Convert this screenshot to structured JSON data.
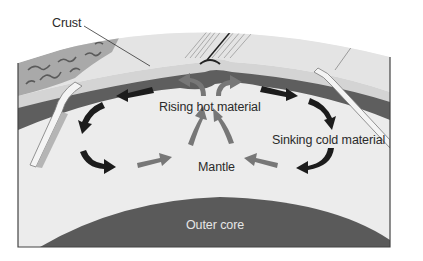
{
  "diagram": {
    "labels": {
      "crust": "Crust",
      "rising": "Rising hot material",
      "sinking": "Sinking cold material",
      "mantle": "Mantle",
      "outer_core": "Outer core"
    },
    "colors": {
      "background": "#ffffff",
      "mantle": "#ececec",
      "lithosphere_dark": "#5e5e5e",
      "crust_light": "#dcdcdc",
      "continent": "#a8a8a8",
      "outer_core": "#5a5a5a",
      "cold_arrow": "#1c1c1c",
      "hot_arrow": "#777777",
      "border": "#444444"
    }
  }
}
